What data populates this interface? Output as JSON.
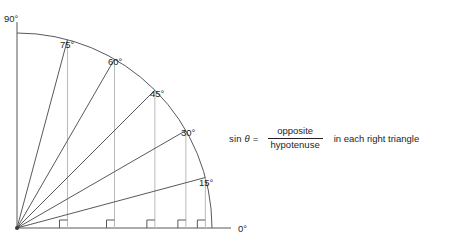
{
  "figure": {
    "type": "unit-circle-sine-diagram",
    "origin": {
      "x": 17,
      "y": 228
    },
    "radius": 195,
    "axis_top_y": 22,
    "baseline_end_x": 231,
    "stroke_color": "#58595b",
    "drop_line_color": "#b9babc",
    "text_color": "#231f20"
  },
  "labels": {
    "vertical_axis": "90°",
    "horizontal_axis": "0°",
    "angles": [
      {
        "value": "75°",
        "degrees": 75,
        "x": 60,
        "y": 40
      },
      {
        "value": "60°",
        "degrees": 60,
        "x": 108,
        "y": 57
      },
      {
        "value": "45°",
        "degrees": 45,
        "x": 150,
        "y": 89
      },
      {
        "value": "30°",
        "degrees": 30,
        "x": 181,
        "y": 128
      },
      {
        "value": "15°",
        "degrees": 15,
        "x": 199,
        "y": 178
      }
    ],
    "axis_label_positions": {
      "vertical": {
        "x": 4,
        "y": 18
      },
      "horizontal": {
        "x": 238,
        "y": 224
      }
    }
  },
  "geometry": {
    "rays": [
      15,
      30,
      45,
      60,
      75
    ],
    "drop_lines": [
      15,
      30,
      45,
      60,
      75
    ],
    "right_angle_marker_size": 8
  },
  "formula": {
    "function_name": "sin",
    "variable": "θ",
    "equals": "=",
    "numerator": "opposite",
    "denominator": "hypotenuse",
    "tail": "in each right triangle"
  }
}
